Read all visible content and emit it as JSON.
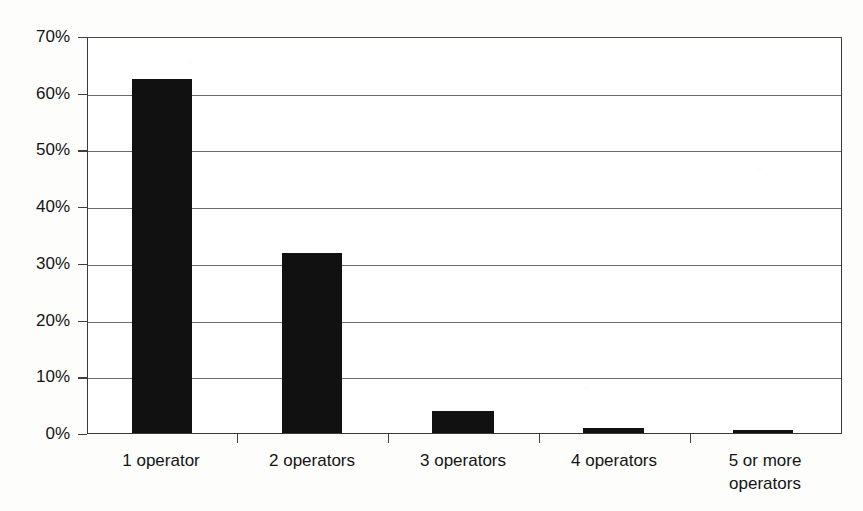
{
  "chart_data": {
    "type": "bar",
    "title": "",
    "subtitle": "",
    "xlabel": "",
    "ylabel": "",
    "categories": [
      "1 operator",
      "2 operators",
      "3 operators",
      "4 operators",
      "5 or more operators"
    ],
    "category_lines": [
      [
        "1 operator"
      ],
      [
        "2 operators"
      ],
      [
        "3 operators"
      ],
      [
        "4 operators"
      ],
      [
        "5 or more",
        "operators"
      ]
    ],
    "values": [
      62.4,
      31.7,
      3.8,
      0.9,
      0.5
    ],
    "value_labels": [
      "62.4%",
      "31.7%",
      "3.8%",
      "0.9%",
      "0.5%"
    ],
    "ylim": [
      0,
      70
    ],
    "y_ticks": [
      0,
      10,
      20,
      30,
      40,
      50,
      60,
      70
    ],
    "y_tick_labels": [
      "0%",
      "10%",
      "20%",
      "30%",
      "40%",
      "50%",
      "60%",
      "70%"
    ],
    "grid": true,
    "grid_axis": "y",
    "legend": null,
    "legend_position": "none",
    "series": [
      {
        "name": "share of respondents",
        "values": [
          62.4,
          31.7,
          3.8,
          0.9,
          0.5
        ]
      }
    ],
    "colors": {
      "bar_fill": "#111111",
      "gridline": "#6b6b6b",
      "axis_line": "#3a3a3a",
      "text": "#141414",
      "background": "#ffffff"
    }
  }
}
